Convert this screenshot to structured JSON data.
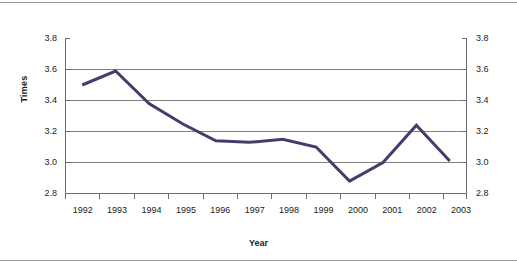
{
  "chart_data": {
    "type": "line",
    "title": "",
    "xlabel": "Year",
    "ylabel": "Times",
    "categories": [
      "1992",
      "1993",
      "1994",
      "1995",
      "1996",
      "1997",
      "1998",
      "1999",
      "2000",
      "2001",
      "2002",
      "2003"
    ],
    "x": [
      1992,
      1993,
      1994,
      1995,
      1996,
      1997,
      1998,
      1999,
      2000,
      2001,
      2002,
      2003
    ],
    "values": [
      3.5,
      3.59,
      3.38,
      3.25,
      3.14,
      3.13,
      3.15,
      3.1,
      2.88,
      3.0,
      3.24,
      3.01
    ],
    "series": [
      {
        "name": "Times",
        "values": [
          3.5,
          3.59,
          3.38,
          3.25,
          3.14,
          3.13,
          3.15,
          3.1,
          2.88,
          3.0,
          3.24,
          3.01
        ],
        "color": "#3f3f6e"
      }
    ],
    "ylim": [
      2.8,
      3.8
    ],
    "yticks": [
      2.8,
      3.0,
      3.2,
      3.4,
      3.6,
      3.8
    ],
    "ytick_labels": [
      "2.8",
      "3.0",
      "3.2",
      "3.4",
      "3.6",
      "3.8"
    ],
    "ytick_labels_right": [
      "2.8",
      "3.0",
      "3.2",
      "3.4",
      "3.6",
      "3.8"
    ],
    "xtick_labels": [
      "1992",
      "1993",
      "1994",
      "1995",
      "1996",
      "1997",
      "1998",
      "1999",
      "2000",
      "2001",
      "2002",
      "2003"
    ],
    "grid": "horizontal",
    "gridline_color": "#808080",
    "axis_color": "#6e6e6e",
    "legend": "none",
    "dual_y_axis": true,
    "marker": "none",
    "line_width": 3
  },
  "axes": {
    "y_axis_title": "Times",
    "x_axis_title": "Year"
  }
}
